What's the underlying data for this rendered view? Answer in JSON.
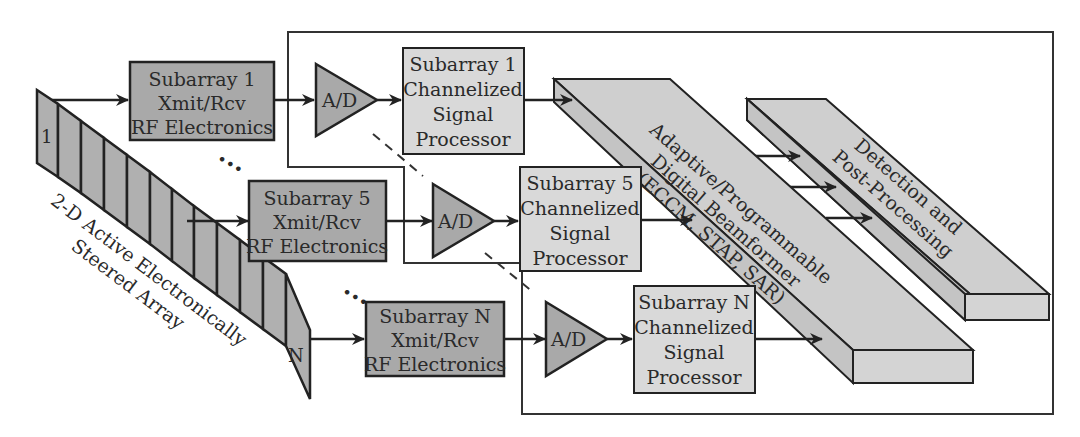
{
  "diagram": {
    "array": {
      "label_line1": "2-D Active Electronically",
      "label_line2": "Steered Array",
      "first_element": "1",
      "last_element": "N",
      "element_count": 13
    },
    "rf_modules": [
      {
        "line1": "Subarray 1",
        "line2": "Xmit/Rcv",
        "line3": "RF Electronics"
      },
      {
        "line1": "Subarray 5",
        "line2": "Xmit/Rcv",
        "line3": "RF Electronics"
      },
      {
        "line1": "Subarray N",
        "line2": "Xmit/Rcv",
        "line3": "RF Electronics"
      }
    ],
    "adcs": [
      {
        "label": "A/D"
      },
      {
        "label": "A/D"
      },
      {
        "label": "A/D"
      }
    ],
    "signal_processors": [
      {
        "line1": "Subarray 1",
        "line2": "Channelized",
        "line3": "Signal",
        "line4": "Processor"
      },
      {
        "line1": "Subarray 5",
        "line2": "Channelized",
        "line3": "Signal",
        "line4": "Processor"
      },
      {
        "line1": "Subarray N",
        "line2": "Channelized",
        "line3": "Signal",
        "line4": "Processor"
      }
    ],
    "beamformer": {
      "line1": "Adaptive/Programmable",
      "line2": "Digital Beamformer",
      "line3": "(ECCM, STAP, SAR)"
    },
    "detection": {
      "line1": "Detection and",
      "line2": "Post-Processing"
    },
    "ellipsis": "•••",
    "colors": {
      "dark_fill": "#a9a9a9",
      "light_fill": "#d9d9d9",
      "stroke": "#222222"
    }
  }
}
